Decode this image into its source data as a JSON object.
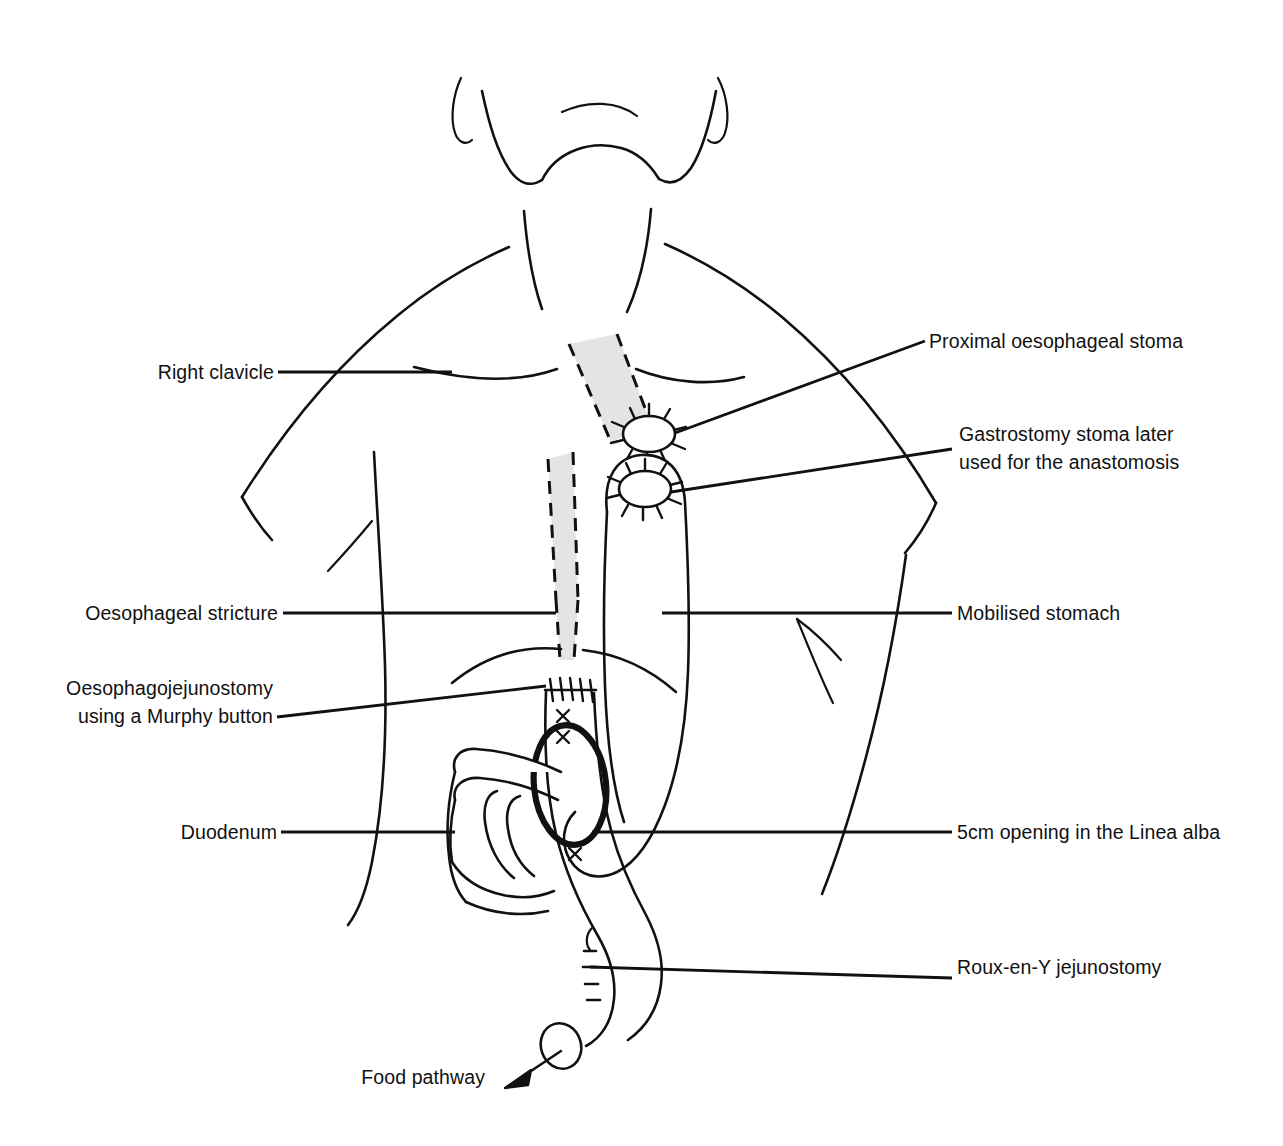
{
  "figure": {
    "background_color": "#ffffff",
    "ink_color": "#111111",
    "shaded_color": "#e4e4e4"
  },
  "labels": {
    "right_clavicle": "Right clavicle",
    "proximal_oesophageal_stoma": "Proximal oesophageal stoma",
    "gastrostomy_stoma_line1": "Gastrostomy stoma later",
    "gastrostomy_stoma_line2": "used for the anastomosis",
    "oesophageal_stricture": "Oesophageal stricture",
    "mobilised_stomach": "Mobilised stomach",
    "oesophagojejunostomy_line1": "Oesophagojejunostomy",
    "oesophagojejunostomy_line2": "using a Murphy button",
    "duodenum": "Duodenum",
    "linea_alba_opening": "5cm opening in the Linea alba",
    "roux_en_y_jejunostomy": "Roux-en-Y jejunostomy",
    "food_pathway": "Food pathway"
  },
  "icons": {
    "stoma": "stoma-sutured-ellipse-icon",
    "arrow": "food-pathway-arrow-icon",
    "suture_row": "suture-line-icon",
    "x_marks": "stitch-x-mark-icon"
  }
}
